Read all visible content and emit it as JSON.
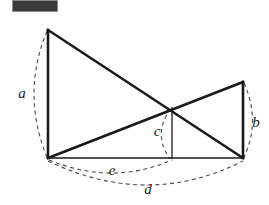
{
  "figure": {
    "name": "crossed-ladders-diagram",
    "background_color": "#ffffff",
    "line_color": "#1a1a1a",
    "dash_color": "#4a4a4a",
    "width": 269,
    "height": 205
  },
  "redaction": {
    "label": "",
    "fill_color": "#3a3a3a",
    "border_color": "#8c8c8c",
    "x": 12,
    "y": 0,
    "width": 46,
    "height": 12
  },
  "points": {
    "top_left": {
      "name": "A",
      "x": 48,
      "y": 30
    },
    "bottom_left": {
      "name": "B",
      "x": 48,
      "y": 158
    },
    "top_right": {
      "name": "C",
      "x": 243,
      "y": 82
    },
    "bottom_right": {
      "name": "D",
      "x": 243,
      "y": 158
    },
    "intersection": {
      "name": "P",
      "x": 172,
      "y": 108
    },
    "foot": {
      "name": "F",
      "x": 172,
      "y": 158
    }
  },
  "segments": [
    {
      "name": "left-vertical-pole",
      "from": "top_left",
      "to": "bottom_left",
      "weight": "thick",
      "measure": "a"
    },
    {
      "name": "right-vertical-pole",
      "from": "top_right",
      "to": "bottom_right",
      "weight": "thick",
      "measure": "b"
    },
    {
      "name": "baseline",
      "from": "bottom_left",
      "to": "bottom_right",
      "weight": "thin",
      "measure": "d"
    },
    {
      "name": "diagonal-left-to-right-base",
      "from": "top_left",
      "to": "bottom_right",
      "weight": "thick",
      "measure": ""
    },
    {
      "name": "diagonal-right-to-left-base",
      "from": "top_right",
      "to": "bottom_left",
      "weight": "thick",
      "measure": ""
    },
    {
      "name": "intersection-drop-line",
      "from": "intersection",
      "to": "foot",
      "weight": "thin",
      "measure": "c"
    }
  ],
  "labels": [
    {
      "id": "a",
      "text": "a",
      "x": 22,
      "y": 95,
      "describes": "left-vertical-pole"
    },
    {
      "id": "b",
      "text": "b",
      "x": 256,
      "y": 124,
      "describes": "right-vertical-pole"
    },
    {
      "id": "c",
      "text": "c",
      "x": 157,
      "y": 133,
      "describes": "intersection-drop-line"
    },
    {
      "id": "e",
      "text": "e",
      "x": 112,
      "y": 172,
      "describes": "baseline-left-segment"
    },
    {
      "id": "d",
      "text": "d",
      "x": 148,
      "y": 191,
      "describes": "baseline-full"
    }
  ],
  "arcs": [
    {
      "id": "arc-a",
      "name": "measure-arc-a",
      "path": "M 47 31 Q 21 94 47 157",
      "measures": "a"
    },
    {
      "id": "arc-b",
      "name": "measure-arc-b",
      "path": "M 244 83 Q 261 121 244 157",
      "measures": "b"
    },
    {
      "id": "arc-c",
      "name": "measure-arc-c",
      "path": "M 171 109 Q 152 133 170 159",
      "measures": "c"
    },
    {
      "id": "arc-e",
      "name": "measure-arc-e",
      "path": "M 49 160 Q 112 186 172 160",
      "measures": "e"
    },
    {
      "id": "arc-d",
      "name": "measure-arc-d",
      "path": "M 48 161 Q 148 209 243 161",
      "measures": "d"
    }
  ]
}
